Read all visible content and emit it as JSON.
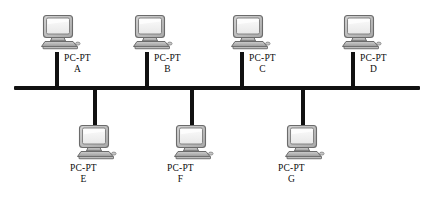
{
  "diagram": {
    "type": "bus-topology-network-diagram",
    "background_color": "#ffffff",
    "line_color": "#111111",
    "device_model": "PC-PT",
    "bus": {
      "name": "shared-bus-backbone",
      "x_start": 14,
      "x_end": 420,
      "y": 88,
      "thickness": 4
    },
    "nodes": [
      {
        "id": "A",
        "model": "PC-PT",
        "name": "A",
        "position": "top",
        "drop_x": 57,
        "icon_x": 36,
        "icon_y": 12,
        "label_x": 64,
        "label_y": 53
      },
      {
        "id": "B",
        "model": "PC-PT",
        "name": "B",
        "position": "top",
        "drop_x": 147,
        "icon_x": 128,
        "icon_y": 12,
        "label_x": 154,
        "label_y": 53
      },
      {
        "id": "C",
        "model": "PC-PT",
        "name": "C",
        "position": "top",
        "drop_x": 242,
        "icon_x": 226,
        "icon_y": 12,
        "label_x": 249,
        "label_y": 53
      },
      {
        "id": "D",
        "model": "PC-PT",
        "name": "D",
        "position": "top",
        "drop_x": 353,
        "icon_x": 337,
        "icon_y": 12,
        "label_x": 360,
        "label_y": 53
      },
      {
        "id": "E",
        "model": "PC-PT",
        "name": "E",
        "position": "bottom",
        "drop_x": 95,
        "icon_x": 72,
        "icon_y": 122,
        "label_x": 70,
        "label_y": 163
      },
      {
        "id": "F",
        "model": "PC-PT",
        "name": "F",
        "position": "bottom",
        "drop_x": 192,
        "icon_x": 169,
        "icon_y": 122,
        "label_x": 167,
        "label_y": 163
      },
      {
        "id": "G",
        "model": "PC-PT",
        "name": "G",
        "position": "bottom",
        "drop_x": 303,
        "icon_x": 280,
        "icon_y": 122,
        "label_x": 278,
        "label_y": 163
      }
    ]
  }
}
